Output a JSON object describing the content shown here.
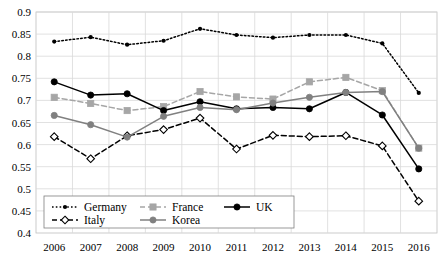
{
  "chart_data": {
    "type": "line",
    "title": "",
    "xlabel": "",
    "ylabel": "",
    "categories": [
      "2006",
      "2007",
      "2008",
      "2009",
      "2010",
      "2011",
      "2012",
      "2013",
      "2014",
      "2015",
      "2016"
    ],
    "ylim": [
      0.4,
      0.9
    ],
    "yticks": [
      0.4,
      0.45,
      0.5,
      0.55,
      0.6,
      0.65,
      0.7,
      0.75,
      0.8,
      0.85,
      0.9
    ],
    "ytick_labels": [
      "0.4",
      "0.45",
      "0.5",
      "0.55",
      "0.6",
      "0.65",
      "0.7",
      "0.75",
      "0.8",
      "0.85",
      "0.9"
    ],
    "grid": true,
    "legend_position": "bottom-left-inside",
    "series": [
      {
        "name": "Germany",
        "color": "#000000",
        "style": "dotted",
        "marker": "dot",
        "values": [
          0.833,
          0.843,
          0.826,
          0.835,
          0.862,
          0.848,
          0.842,
          0.848,
          0.848,
          0.829,
          0.717
        ]
      },
      {
        "name": "France",
        "color": "#a6a6a6",
        "style": "dashed",
        "marker": "square",
        "values": [
          0.707,
          0.693,
          0.677,
          0.686,
          0.72,
          0.708,
          0.703,
          0.742,
          0.752,
          0.722,
          0.592
        ]
      },
      {
        "name": "UK",
        "color": "#000000",
        "style": "solid",
        "marker": "circle",
        "values": [
          0.742,
          0.712,
          0.715,
          0.677,
          0.697,
          0.681,
          0.684,
          0.681,
          0.718,
          0.667,
          0.545
        ]
      },
      {
        "name": "Italy",
        "color": "#000000",
        "style": "dashed",
        "marker": "open-diamond",
        "values": [
          0.618,
          0.568,
          0.62,
          0.634,
          0.66,
          0.59,
          0.621,
          0.618,
          0.62,
          0.597,
          0.472
        ]
      },
      {
        "name": "Korea",
        "color": "#808080",
        "style": "solid",
        "marker": "circle",
        "values": [
          0.666,
          0.645,
          0.617,
          0.664,
          0.684,
          0.679,
          0.694,
          0.707,
          0.718,
          0.72,
          0.592
        ]
      }
    ]
  },
  "legend": {
    "entries": [
      {
        "label": "Germany"
      },
      {
        "label": "France"
      },
      {
        "label": "UK"
      },
      {
        "label": "Italy"
      },
      {
        "label": "Korea"
      }
    ]
  }
}
